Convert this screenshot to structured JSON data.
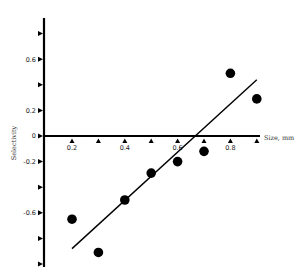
{
  "chart_data": {
    "type": "scatter",
    "title": "",
    "xlabel": "Size, mm",
    "ylabel": "Selectivity",
    "xlim": [
      0.1,
      0.9
    ],
    "ylim": [
      -1.0,
      0.9
    ],
    "grid": false,
    "legend": null,
    "x_ticks": [
      0.2,
      0.3,
      0.4,
      0.5,
      0.6,
      0.7,
      0.8,
      0.9
    ],
    "x_tick_labels": [
      "0.2",
      "",
      "0.4",
      "",
      "0.6",
      "",
      "0.8",
      ""
    ],
    "y_ticks": [
      0.8,
      0.6,
      0.4,
      0.2,
      0,
      -0.2,
      -0.4,
      -0.6,
      -0.8,
      -1.0
    ],
    "y_tick_labels": [
      "",
      "0.6",
      "",
      "0.2",
      "0",
      "-0.2",
      "",
      "-0.6",
      "",
      ""
    ],
    "series": [
      {
        "name": "observed",
        "type": "scatter",
        "marker": "filled-circle",
        "color": "#000000",
        "x": [
          0.2,
          0.3,
          0.4,
          0.5,
          0.6,
          0.7,
          0.8,
          0.9
        ],
        "y": [
          -0.65,
          -0.91,
          -0.5,
          -0.29,
          -0.2,
          -0.12,
          0.49,
          0.29
        ]
      },
      {
        "name": "regression line",
        "type": "line",
        "color": "#000000",
        "x": [
          0.2,
          0.9
        ],
        "y": [
          -0.88,
          0.44
        ]
      }
    ]
  }
}
